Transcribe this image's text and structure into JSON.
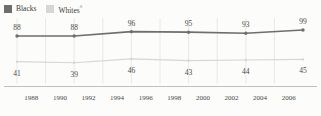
{
  "chart_data": {
    "type": "line",
    "title": "",
    "subtitle": "",
    "xlabel": "",
    "ylabel": "",
    "grid": "vertical-only",
    "legend_position": "top-left",
    "x": [
      1988,
      1992,
      1996,
      2000,
      2004,
      2008
    ],
    "xtick_labels": [
      "1988",
      "1990",
      "1992",
      "1994",
      "1996",
      "1998",
      "2000",
      "2002",
      "2004",
      "2006"
    ],
    "ylim": [
      0,
      110
    ],
    "series": [
      {
        "name": "Blacks",
        "color": "#6e6e6c",
        "values": [
          88,
          88,
          96,
          95,
          93,
          99
        ],
        "labels": [
          "88",
          "88",
          "96",
          "95",
          "93",
          "99"
        ]
      },
      {
        "name": "Whites",
        "name_suffix": "^",
        "color": "#d6d6d2",
        "values": [
          41,
          39,
          46,
          43,
          44,
          45
        ],
        "labels": [
          "41",
          "39",
          "46",
          "43",
          "44",
          "45"
        ]
      }
    ],
    "colors": {
      "series_blacks": "#6e6e6c",
      "series_whites": "#d6d6d2",
      "gridline": "#e4e4e0",
      "axis": "#b9b9b4",
      "text": "#4a4a48",
      "background": "#fcfcfb"
    }
  },
  "legend": {
    "items": [
      {
        "label": "Blacks",
        "suffix": "",
        "swatch_color": "#6e6e6c"
      },
      {
        "label": "Whites",
        "suffix": "^",
        "swatch_color": "#d6d6d2"
      }
    ]
  }
}
